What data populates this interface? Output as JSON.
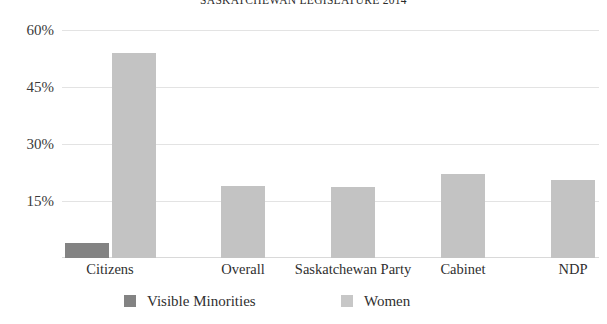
{
  "chart_data": {
    "type": "bar",
    "title": "SASKATCHEWAN LEGISLATURE 2014",
    "xlabel": "",
    "ylabel": "",
    "ylim": [
      0,
      60
    ],
    "yticks": [
      "60%",
      "45%",
      "30%",
      "15%"
    ],
    "ytick_values": [
      60,
      45,
      30,
      15
    ],
    "grid": true,
    "legend_position": "bottom",
    "categories": [
      "Citizens",
      "Overall",
      "Saskatchewan Party",
      "Cabinet",
      "NDP"
    ],
    "series": [
      {
        "name": "Visible Minorities",
        "color": "#838383",
        "values": [
          4,
          null,
          null,
          null,
          null
        ]
      },
      {
        "name": "Women",
        "color": "#c3c3c3",
        "values": [
          54,
          19,
          18.7,
          22.2,
          20.5
        ]
      }
    ]
  },
  "legend": {
    "items": [
      {
        "label": "Visible Minorities",
        "swatch": "#838383"
      },
      {
        "label": "Women",
        "swatch": "#c7c7c7"
      }
    ]
  }
}
